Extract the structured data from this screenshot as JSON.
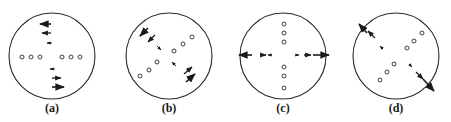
{
  "figure": {
    "stroke_color": "#2a2a2a",
    "background": "#ffffff",
    "panels": [
      {
        "label": "(a)",
        "cx": 52,
        "cy": 56,
        "r": 43,
        "pattern": "horizontal row of dots; vertical column of arrows: upper arrows point left, lower arrows point right",
        "dots": [
          [
            22,
            57
          ],
          [
            31,
            57
          ],
          [
            40,
            57
          ],
          [
            62,
            57
          ],
          [
            71,
            57
          ],
          [
            80,
            57
          ]
        ],
        "arrows": [
          {
            "x1": 51,
            "y1": 24,
            "x2": 40,
            "y2": 24,
            "size": "large"
          },
          {
            "x1": 51,
            "y1": 33,
            "x2": 42,
            "y2": 33,
            "size": "medium"
          },
          {
            "x1": 52,
            "y1": 43,
            "x2": 47,
            "y2": 43,
            "size": "small"
          },
          {
            "x1": 55,
            "y1": 69,
            "x2": 50,
            "y2": 69,
            "size": "small"
          },
          {
            "x1": 52,
            "y1": 78,
            "x2": 61,
            "y2": 78,
            "size": "medium"
          },
          {
            "x1": 52,
            "y1": 87,
            "x2": 64,
            "y2": 87,
            "size": "large"
          }
        ]
      },
      {
        "label": "(b)",
        "cx": 169,
        "cy": 56,
        "r": 43,
        "pattern": "diagonal dots lower-left to upper-right; arrows along other diagonal pointing inward/outward",
        "dots": [
          [
            140,
            76
          ],
          [
            149,
            70
          ],
          [
            157,
            62
          ],
          [
            174,
            51
          ],
          [
            183,
            44
          ],
          [
            192,
            37
          ]
        ],
        "arrows": [
          {
            "x1": 148,
            "y1": 28,
            "x2": 140,
            "y2": 36,
            "size": "large"
          },
          {
            "x1": 155,
            "y1": 35,
            "x2": 148,
            "y2": 42,
            "size": "medium"
          },
          {
            "x1": 157,
            "y1": 46,
            "x2": 161,
            "y2": 50,
            "size": "small"
          },
          {
            "x1": 176,
            "y1": 66,
            "x2": 172,
            "y2": 62,
            "size": "small"
          },
          {
            "x1": 184,
            "y1": 74,
            "x2": 192,
            "y2": 67,
            "size": "medium"
          },
          {
            "x1": 186,
            "y1": 82,
            "x2": 195,
            "y2": 74,
            "size": "large"
          }
        ]
      },
      {
        "label": "(c)",
        "cx": 283,
        "cy": 56,
        "r": 43,
        "pattern": "vertical column of dots; horizontal row of arrows pointing outward, extending past circle edge",
        "dots": [
          [
            284,
            24
          ],
          [
            284,
            33
          ],
          [
            284,
            42
          ],
          [
            284,
            67
          ],
          [
            284,
            76
          ],
          [
            284,
            88
          ]
        ],
        "arrows": [
          {
            "x1": 252,
            "y1": 55,
            "x2": 239,
            "y2": 55,
            "size": "large"
          },
          {
            "x1": 260,
            "y1": 55,
            "x2": 266,
            "y2": 55,
            "size": "medium"
          },
          {
            "x1": 272,
            "y1": 55,
            "x2": 268,
            "y2": 55,
            "size": "small"
          },
          {
            "x1": 295,
            "y1": 55,
            "x2": 299,
            "y2": 55,
            "size": "small"
          },
          {
            "x1": 304,
            "y1": 55,
            "x2": 311,
            "y2": 55,
            "size": "medium"
          },
          {
            "x1": 313,
            "y1": 55,
            "x2": 329,
            "y2": 55,
            "size": "large"
          }
        ]
      },
      {
        "label": "(d)",
        "cx": 396,
        "cy": 56,
        "r": 43,
        "pattern": "diagonal dots lower-left to upper-right; arrows along other diagonal pointing outward past circle edge",
        "dots": [
          [
            380,
            80
          ],
          [
            387,
            72
          ],
          [
            394,
            64
          ],
          [
            407,
            48
          ],
          [
            414,
            41
          ],
          [
            422,
            33
          ]
        ],
        "arrows": [
          {
            "x1": 375,
            "y1": 38,
            "x2": 368,
            "y2": 31,
            "size": "medium"
          },
          {
            "x1": 383,
            "y1": 49,
            "x2": 380,
            "y2": 46,
            "size": "small"
          },
          {
            "x1": 367,
            "y1": 33,
            "x2": 359,
            "y2": 24,
            "size": "large"
          },
          {
            "x1": 409,
            "y1": 64,
            "x2": 412,
            "y2": 67,
            "size": "small"
          },
          {
            "x1": 416,
            "y1": 72,
            "x2": 423,
            "y2": 79,
            "size": "medium"
          },
          {
            "x1": 423,
            "y1": 79,
            "x2": 434,
            "y2": 91,
            "size": "large"
          }
        ]
      }
    ],
    "label_y": 108
  }
}
